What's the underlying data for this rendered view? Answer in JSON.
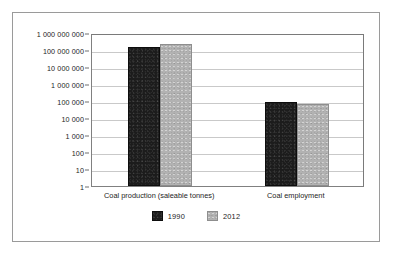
{
  "chart_data": {
    "type": "bar",
    "title": "",
    "xlabel": "",
    "ylabel": "",
    "categories": [
      "Coal production (saleable tonnes)",
      "Coal employment"
    ],
    "series": [
      {
        "name": "1990",
        "color": "#1c1c1c",
        "values": [
          150000000,
          90000
        ]
      },
      {
        "name": "2012",
        "color": "#b2b2b2",
        "values": [
          230000000,
          70000
        ]
      }
    ],
    "yscale": "log",
    "ylim": [
      1,
      1000000000
    ],
    "ytick_values": [
      1000000000,
      100000000,
      10000000,
      1000000,
      100000,
      10000,
      1000,
      100,
      10,
      1
    ],
    "ytick_labels": [
      "1 000 000 000",
      "100 000 000",
      "10 000 000",
      "1 000 000",
      "100 000",
      "10 000",
      "1 000",
      "100",
      "10",
      "1"
    ],
    "grid": true,
    "legend_position": "bottom",
    "legend_entries": [
      "1990",
      "2012"
    ]
  }
}
